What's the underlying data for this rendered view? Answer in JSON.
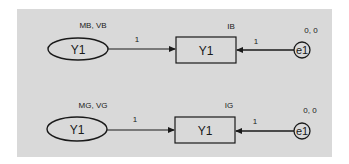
{
  "diagram": {
    "background_color": "#d9d9d9",
    "stroke_color": "#1a1a1a",
    "models": [
      {
        "name": "model-b",
        "latent": {
          "label": "Y1",
          "params": "MB, VB"
        },
        "observed": {
          "label": "Y1",
          "intercept": "IB"
        },
        "error": {
          "label": "e1",
          "params": "0, 0"
        },
        "paths": [
          {
            "from": "latent",
            "to": "observed",
            "weight": "1"
          },
          {
            "from": "error",
            "to": "observed",
            "weight": "1"
          }
        ]
      },
      {
        "name": "model-g",
        "latent": {
          "label": "Y1",
          "params": "MG, VG"
        },
        "observed": {
          "label": "Y1",
          "intercept": "IG"
        },
        "error": {
          "label": "e1",
          "params": "0, 0"
        },
        "paths": [
          {
            "from": "latent",
            "to": "observed",
            "weight": "1"
          },
          {
            "from": "error",
            "to": "observed",
            "weight": "1"
          }
        ]
      }
    ]
  }
}
